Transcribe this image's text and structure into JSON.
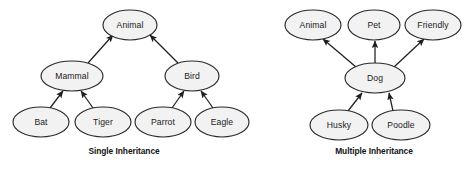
{
  "figure": {
    "background_color": "#ffffff",
    "node_fill_color": "#f2f2f2",
    "node_stroke_color": "#2b2b2b",
    "edge_color": "#1f1f1f",
    "text_color": "#1a1a1a"
  },
  "diagrams": [
    {
      "id": "single-inheritance",
      "caption": "Single Inheritance",
      "caption_x": 124,
      "caption_y": 154,
      "nodes": [
        {
          "id": "animal",
          "label": "Animal",
          "cx": 130,
          "cy": 25,
          "rx": 27,
          "ry": 15
        },
        {
          "id": "mammal",
          "label": "Mammal",
          "cx": 72,
          "cy": 76,
          "rx": 31,
          "ry": 15
        },
        {
          "id": "bird",
          "label": "Bird",
          "cx": 192,
          "cy": 76,
          "rx": 27,
          "ry": 15
        },
        {
          "id": "bat",
          "label": "Bat",
          "cx": 41,
          "cy": 122,
          "rx": 28,
          "ry": 15
        },
        {
          "id": "tiger",
          "label": "Tiger",
          "cx": 103,
          "cy": 122,
          "rx": 28,
          "ry": 15
        },
        {
          "id": "parrot",
          "label": "Parrot",
          "cx": 163,
          "cy": 122,
          "rx": 28,
          "ry": 15
        },
        {
          "id": "eagle",
          "label": "Eagle",
          "cx": 222,
          "cy": 122,
          "rx": 27,
          "ry": 15
        }
      ],
      "edges": [
        {
          "from": "mammal",
          "to": "animal",
          "x1": 88,
          "y1": 63,
          "x2": 113,
          "y2": 35
        },
        {
          "from": "bird",
          "to": "animal",
          "x1": 178,
          "y1": 63,
          "x2": 150,
          "y2": 35
        },
        {
          "from": "bat",
          "to": "mammal",
          "x1": 50,
          "y1": 108,
          "x2": 63,
          "y2": 91
        },
        {
          "from": "tiger",
          "to": "mammal",
          "x1": 93,
          "y1": 108,
          "x2": 81,
          "y2": 91
        },
        {
          "from": "parrot",
          "to": "bird",
          "x1": 172,
          "y1": 108,
          "x2": 184,
          "y2": 91
        },
        {
          "from": "eagle",
          "to": "bird",
          "x1": 213,
          "y1": 108,
          "x2": 201,
          "y2": 91
        }
      ]
    },
    {
      "id": "multiple-inheritance",
      "caption": "Multiple Inheritance",
      "caption_x": 374,
      "caption_y": 154,
      "nodes": [
        {
          "id": "animal2",
          "label": "Animal",
          "cx": 313,
          "cy": 25,
          "rx": 28,
          "ry": 15
        },
        {
          "id": "pet",
          "label": "Pet",
          "cx": 374,
          "cy": 25,
          "rx": 26,
          "ry": 15
        },
        {
          "id": "friendly",
          "label": "Friendly",
          "cx": 433,
          "cy": 25,
          "rx": 28,
          "ry": 15
        },
        {
          "id": "dog",
          "label": "Dog",
          "cx": 375,
          "cy": 78,
          "rx": 30,
          "ry": 15
        },
        {
          "id": "husky",
          "label": "Husky",
          "cx": 339,
          "cy": 125,
          "rx": 29,
          "ry": 15
        },
        {
          "id": "poodle",
          "label": "Poodle",
          "cx": 401,
          "cy": 125,
          "rx": 29,
          "ry": 15
        }
      ],
      "edges": [
        {
          "from": "dog",
          "to": "animal2",
          "x1": 356,
          "y1": 67,
          "x2": 323,
          "y2": 39
        },
        {
          "from": "dog",
          "to": "pet",
          "x1": 375,
          "y1": 63,
          "x2": 375,
          "y2": 41
        },
        {
          "from": "dog",
          "to": "friendly",
          "x1": 394,
          "y1": 67,
          "x2": 424,
          "y2": 39
        },
        {
          "from": "husky",
          "to": "dog",
          "x1": 348,
          "y1": 111,
          "x2": 362,
          "y2": 93
        },
        {
          "from": "poodle",
          "to": "dog",
          "x1": 393,
          "y1": 111,
          "x2": 389,
          "y2": 93
        }
      ]
    }
  ]
}
